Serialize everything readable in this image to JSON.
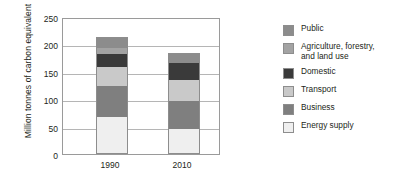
{
  "chart_data": {
    "type": "bar",
    "stacked": true,
    "title": "",
    "subtitle": "",
    "xlabel": "",
    "ylabel": "Million tonnes of carbon equivalent",
    "categories": [
      "1990",
      "2010"
    ],
    "ylim": [
      0,
      250
    ],
    "yticks": [
      0,
      50,
      100,
      150,
      200,
      250
    ],
    "ytick_labels": [
      "0",
      "50",
      "100",
      "150",
      "200",
      "250"
    ],
    "grid": true,
    "legend_position": "right",
    "series": [
      {
        "name": "Energy supply",
        "values": [
          65,
          43
        ],
        "color": "#efefef"
      },
      {
        "name": "Business",
        "values": [
          57,
          52
        ],
        "color": "#7f7f7f"
      },
      {
        "name": "Transport",
        "values": [
          35,
          38
        ],
        "color": "#c9c9c9"
      },
      {
        "name": "Domestic",
        "values": [
          23,
          32
        ],
        "color": "#3a3a3a"
      },
      {
        "name": "Agriculture, forestry,\nand land use",
        "values": [
          12,
          0
        ],
        "color": "#a3a3a3"
      },
      {
        "name": "Public",
        "values": [
          18,
          15
        ],
        "color": "#8c8c8c"
      }
    ],
    "totals": [
      210,
      180
    ],
    "stack_order_bottom_to_top": [
      "Energy supply",
      "Business",
      "Transport",
      "Domestic",
      "Agriculture, forestry, and land use",
      "Public"
    ]
  },
  "axis": {
    "y_title": "Million tonnes of carbon equivalent",
    "y_tick_0": "0",
    "y_tick_50": "50",
    "y_tick_100": "100",
    "y_tick_150": "150",
    "y_tick_200": "200",
    "y_tick_250": "250",
    "x_label_1": "1990",
    "x_label_2": "2010"
  },
  "legend": {
    "items": [
      {
        "label": "Public",
        "color": "#8c8c8c"
      },
      {
        "label": "Agriculture, forestry,\nand land use",
        "color": "#a3a3a3"
      },
      {
        "label": "Domestic",
        "color": "#3a3a3a"
      },
      {
        "label": "Transport",
        "color": "#c9c9c9"
      },
      {
        "label": "Business",
        "color": "#7f7f7f"
      },
      {
        "label": "Energy supply",
        "color": "#efefef"
      }
    ]
  }
}
